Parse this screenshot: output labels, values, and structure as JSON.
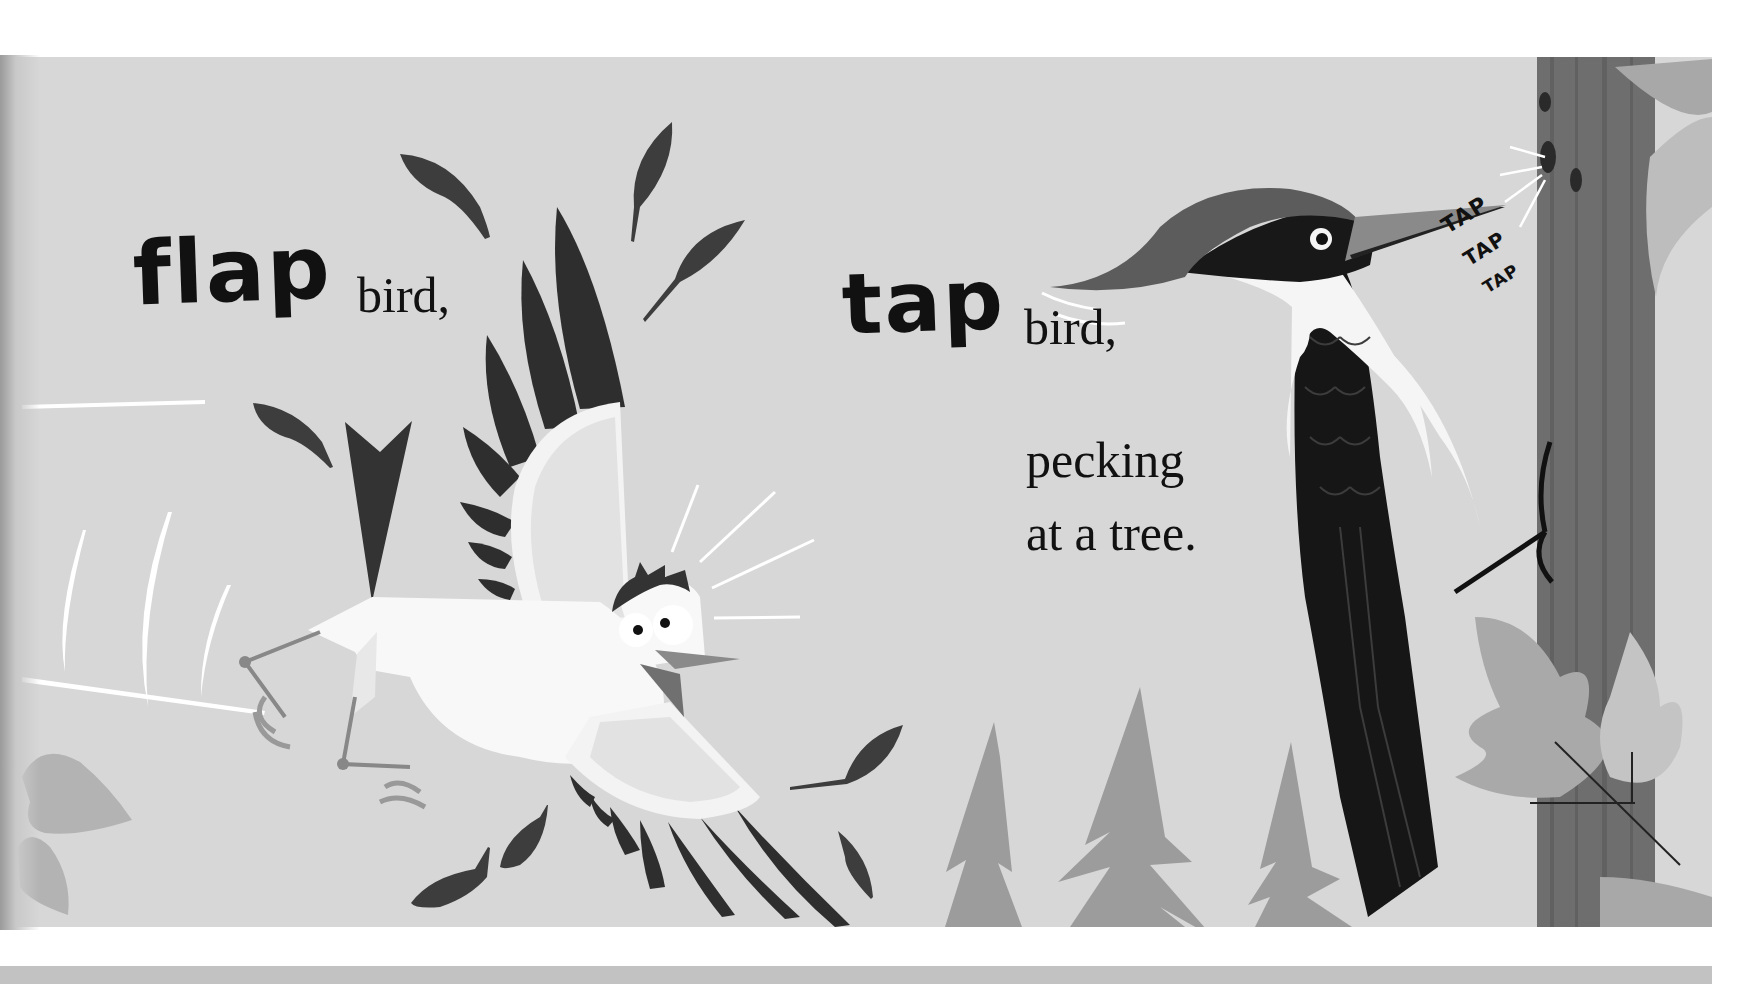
{
  "spread": {
    "left_page": {
      "action_word": "flap",
      "line1": "bird,"
    },
    "right_page": {
      "action_word": "tap",
      "line1": "bird,",
      "line2": "pecking",
      "line3": "at a tree.",
      "sound_effects": [
        "TAP",
        "TAP",
        "TAP"
      ]
    }
  },
  "illustration": {
    "palette": {
      "page_background": "#d7d7d7",
      "ink": "#111111",
      "dark_feather": "#3a3a3a",
      "bird_white": "#f8f8f8",
      "tree_grey": "#9a9a9a",
      "trunk_grey": "#6e6e6e",
      "leaf_grey": "#b3b3b3"
    },
    "elements": [
      "flapping-bird",
      "loose-feathers",
      "woodpecker",
      "tree-trunk",
      "pine-trees",
      "leaves",
      "motion-lines"
    ]
  }
}
